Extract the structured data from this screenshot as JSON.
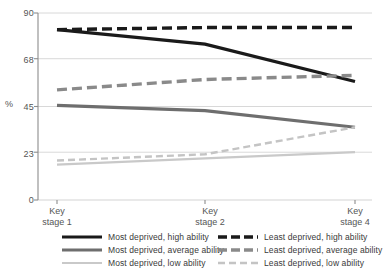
{
  "chart_data": {
    "type": "line",
    "title": "",
    "xlabel": "",
    "ylabel": "%",
    "categories": [
      "Key stage 1",
      "Key stage 2",
      "Key stage 4"
    ],
    "x_tick_lines": [
      [
        "Key",
        "stage 1"
      ],
      [
        "Key",
        "stage 2"
      ],
      [
        "Key",
        "stage 4"
      ]
    ],
    "ylim": [
      0,
      90
    ],
    "yticks": [
      0,
      23,
      45,
      68,
      90
    ],
    "ytick_labels": [
      "0",
      "23",
      "45",
      "68",
      "90"
    ],
    "grid": "horizontal",
    "legend_position": "bottom",
    "series": [
      {
        "name": "Most deprived, high ability",
        "values": [
          82,
          75,
          57
        ],
        "color": "#1a1a1a",
        "style": "solid",
        "width": 3.2,
        "legend_column": "left"
      },
      {
        "name": "Most deprived, average ability",
        "values": [
          45.5,
          43,
          35
        ],
        "color": "#6e6e6e",
        "style": "solid",
        "width": 3.2,
        "legend_column": "left"
      },
      {
        "name": "Most deprived, low ability",
        "values": [
          17,
          20,
          23
        ],
        "color": "#c9c9c9",
        "style": "solid",
        "width": 2.2,
        "legend_column": "left"
      },
      {
        "name": "Least deprived, high ability",
        "values": [
          82,
          83,
          83
        ],
        "color": "#1a1a1a",
        "style": "dashed",
        "width": 3.4,
        "legend_column": "right"
      },
      {
        "name": "Least deprived, average ability",
        "values": [
          53,
          58,
          60
        ],
        "color": "#8a8a8a",
        "style": "dashed",
        "width": 3.4,
        "legend_column": "right"
      },
      {
        "name": "Least deprived, low ability",
        "values": [
          19,
          22,
          35
        ],
        "color": "#c4c4c4",
        "style": "dashed",
        "width": 2.4,
        "legend_column": "right"
      }
    ]
  },
  "axes": {
    "y_axis_title": "%",
    "y_tick_0": "0",
    "y_tick_23": "23",
    "y_tick_45": "45",
    "y_tick_68": "68",
    "y_tick_90": "90",
    "x_tick_1_line1": "Key",
    "x_tick_1_line2": "stage 1",
    "x_tick_2_line1": "Key",
    "x_tick_2_line2": "stage 2",
    "x_tick_3_line1": "Key",
    "x_tick_3_line2": "stage 4"
  },
  "legend": {
    "left": [
      "Most deprived, high ability",
      "Most deprived, average ability",
      "Most deprived, low ability"
    ],
    "right": [
      "Least deprived, high ability",
      "Least deprived, average ability",
      "Least deprived, low ability"
    ]
  },
  "colors": {
    "series_high_most": "#1a1a1a",
    "series_avg_most": "#6e6e6e",
    "series_low_most": "#c9c9c9",
    "series_high_least": "#1a1a1a",
    "series_avg_least": "#8a8a8a",
    "series_low_least": "#c4c4c4",
    "gridline": "#d4d4d4",
    "axis": "#8c8c8c",
    "text": "#4a4a4a"
  }
}
